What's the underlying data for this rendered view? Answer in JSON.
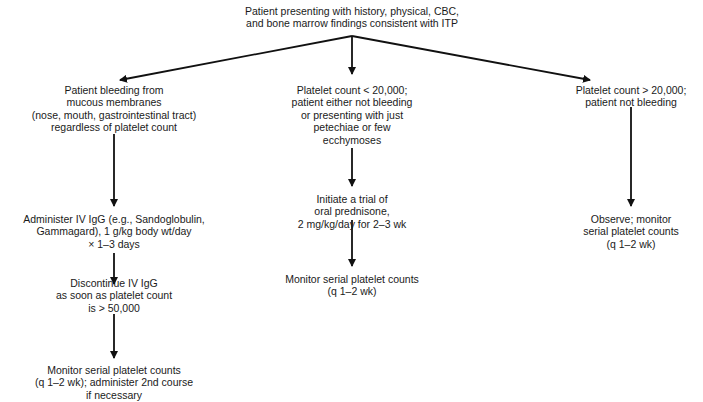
{
  "diagram": {
    "type": "flowchart",
    "root": {
      "id": "root",
      "text": "Patient presenting with history, physical, CBC,\nand bone marrow findings consistent with ITP"
    },
    "branches": [
      {
        "id": "left",
        "nodes": [
          {
            "id": "left-1",
            "text": "Patient bleeding from\nmucous membranes\n(nose, mouth, gastrointestinal tract)\nregardless of platelet count"
          },
          {
            "id": "left-2",
            "text": "Administer IV IgG (e.g., Sandoglobulin,\nGammagard), 1 g/kg body wt/day\n× 1–3 days"
          },
          {
            "id": "left-3",
            "text": "Discontinue IV IgG\nas soon as platelet count\nis > 50,000"
          },
          {
            "id": "left-4",
            "text": "Monitor serial platelet counts\n(q 1–2 wk); administer 2nd course\nif necessary"
          }
        ]
      },
      {
        "id": "middle",
        "nodes": [
          {
            "id": "mid-1",
            "text": "Platelet count < 20,000;\npatient either not bleeding\nor presenting with just\npetechiae or few\necchymoses"
          },
          {
            "id": "mid-2",
            "text": "Initiate a trial of\noral prednisone,\n2 mg/kg/day for 2–3 wk"
          },
          {
            "id": "mid-3",
            "text": "Monitor serial platelet counts\n(q 1–2 wk)"
          }
        ]
      },
      {
        "id": "right",
        "nodes": [
          {
            "id": "right-1",
            "text": "Platelet count > 20,000;\npatient not bleeding"
          },
          {
            "id": "right-2",
            "text": "Observe; monitor\nserial platelet counts\n(q 1–2 wk)"
          }
        ]
      }
    ],
    "edges": [
      [
        "root",
        "left-1"
      ],
      [
        "root",
        "mid-1"
      ],
      [
        "root",
        "right-1"
      ],
      [
        "left-1",
        "left-2"
      ],
      [
        "left-2",
        "left-3"
      ],
      [
        "left-3",
        "left-4"
      ],
      [
        "mid-1",
        "mid-2"
      ],
      [
        "mid-2",
        "mid-3"
      ],
      [
        "right-1",
        "right-2"
      ]
    ]
  }
}
